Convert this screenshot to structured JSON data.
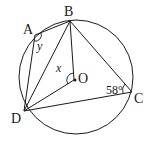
{
  "diagram": {
    "points": {
      "A": {
        "label": "A"
      },
      "B": {
        "label": "B"
      },
      "C": {
        "label": "C"
      },
      "D": {
        "label": "D"
      },
      "O": {
        "label": "O"
      }
    },
    "angles": {
      "x": "x",
      "y": "y",
      "c": "58°"
    },
    "colors": {
      "stroke": "#1a1a1a",
      "background": "#ffffff"
    }
  }
}
